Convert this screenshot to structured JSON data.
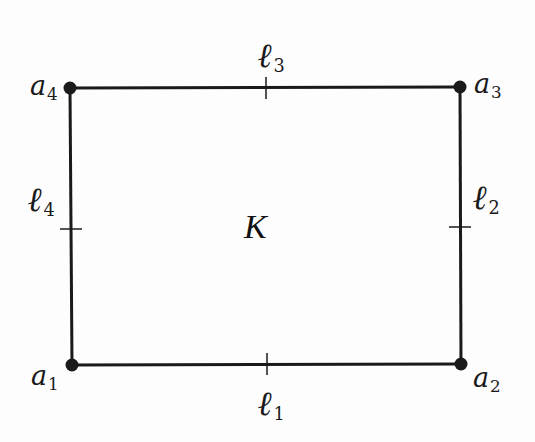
{
  "diagram": {
    "type": "rectangle-element",
    "colors": {
      "stroke": "#1a1a1a",
      "background": "#fdfdfd"
    },
    "center_label": "K",
    "vertices": [
      {
        "id": "a1",
        "base": "a",
        "sub": "1",
        "x": 72,
        "y": 365
      },
      {
        "id": "a2",
        "base": "a",
        "sub": "2",
        "x": 461,
        "y": 364
      },
      {
        "id": "a3",
        "base": "a",
        "sub": "3",
        "x": 460,
        "y": 87
      },
      {
        "id": "a4",
        "base": "a",
        "sub": "4",
        "x": 70,
        "y": 88
      }
    ],
    "edges": [
      {
        "id": "l1",
        "base": "ℓ",
        "sub": "1",
        "side": "bottom",
        "tick": {
          "x": 267,
          "y": 364
        }
      },
      {
        "id": "l2",
        "base": "ℓ",
        "sub": "2",
        "side": "right",
        "tick": {
          "x": 460,
          "y": 227
        }
      },
      {
        "id": "l3",
        "base": "ℓ",
        "sub": "3",
        "side": "top",
        "tick": {
          "x": 266,
          "y": 88
        }
      },
      {
        "id": "l4",
        "base": "ℓ",
        "sub": "4",
        "side": "left",
        "tick": {
          "x": 71,
          "y": 229
        }
      }
    ]
  }
}
